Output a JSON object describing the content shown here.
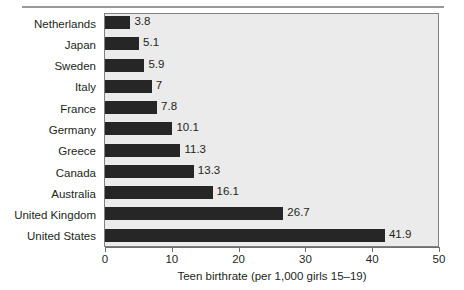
{
  "chart_data": {
    "type": "bar",
    "orientation": "horizontal",
    "title": "",
    "xlabel": "Teen birthrate (per 1,000 girls 15–19)",
    "ylabel": "",
    "xlim": [
      0,
      50
    ],
    "xticks": [
      0,
      10,
      20,
      30,
      40,
      50
    ],
    "xtick_labels": [
      "0",
      "10",
      "20",
      "30",
      "40",
      "50"
    ],
    "grid": false,
    "legend": "none",
    "categories": [
      "Netherlands",
      "Japan",
      "Sweden",
      "Italy",
      "France",
      "Germany",
      "Greece",
      "Canada",
      "Australia",
      "United Kingdom",
      "United States"
    ],
    "values": [
      3.8,
      5.1,
      5.9,
      7,
      7.8,
      10.1,
      11.3,
      13.3,
      16.1,
      26.7,
      41.9
    ],
    "value_labels": [
      "3.8",
      "5.1",
      "5.9",
      "7",
      "7.8",
      "10.1",
      "11.3",
      "13.3",
      "16.1",
      "26.7",
      "41.9"
    ],
    "colors": {
      "bar": "#262626",
      "plot_background": "#ebebeb",
      "plot_border": "#808080",
      "axis": "#6e6e6e",
      "text": "#231f20",
      "top_rule": "#9a9a9a"
    }
  }
}
